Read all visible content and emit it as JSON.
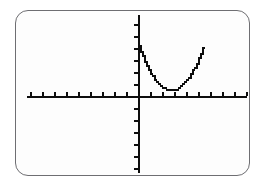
{
  "screen": {
    "device": "graphing-calculator",
    "background_color": "#fdfdfd",
    "bezel_color": "#6e6e72",
    "ink_color": "#0d0d0d",
    "width": 263,
    "height": 190
  },
  "chart_data": {
    "type": "line",
    "title": "",
    "xlabel": "",
    "ylabel": "",
    "subtitle": "",
    "annotations": [],
    "legend": {
      "entries": [],
      "position": "none"
    },
    "grid": false,
    "axes": {
      "x_axis_visible": true,
      "y_axis_visible": true,
      "x_axis_pixel_y": 95,
      "y_axis_pixel_x": 137,
      "x_axis_pixel_start": 26,
      "x_axis_pixel_end": 246,
      "y_axis_pixel_start": 14,
      "y_axis_pixel_end": 172,
      "tick_marks": true,
      "tick_spacing_px": 12,
      "tick_length_px": 4,
      "x_ticks_left_of_origin": 9,
      "x_ticks_right_of_origin": 9,
      "y_ticks_above_origin": 6,
      "y_ticks_below_origin": 6,
      "tick_labels": []
    },
    "xlim": [
      -9.4,
      9.1
    ],
    "ylim": [
      -6.3,
      6.6
    ],
    "x_scale": 1,
    "y_scale": 1,
    "series": [
      {
        "name": "parabola",
        "equation": "y = 0.5(x - 2.7)^2 + 0.55",
        "style": "pixelated-staircase",
        "color": "#0d0d0d",
        "line_width_px": 2,
        "vertex": {
          "x": 2.7,
          "y": 0.55
        },
        "opens": "up",
        "x": [
          0.0,
          0.2,
          0.4,
          0.6,
          0.8,
          1.0,
          1.2,
          1.4,
          1.6,
          1.8,
          2.0,
          2.2,
          2.4,
          2.6,
          2.8,
          3.0,
          3.2,
          3.4,
          3.6,
          3.8,
          4.0,
          4.2,
          4.4,
          4.6,
          4.8,
          5.0,
          5.2,
          5.4
        ],
        "y": [
          4.19,
          3.68,
          3.2,
          2.76,
          2.36,
          2.0,
          1.68,
          1.4,
          1.16,
          0.96,
          0.8,
          0.68,
          0.6,
          0.56,
          0.56,
          0.6,
          0.68,
          0.8,
          0.96,
          1.16,
          1.4,
          1.68,
          2.0,
          2.36,
          2.76,
          3.2,
          3.68,
          4.19
        ]
      }
    ]
  }
}
